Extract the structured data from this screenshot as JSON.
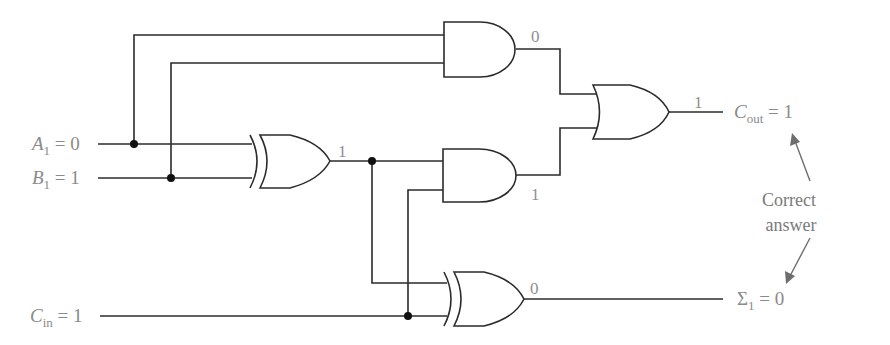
{
  "diagram": {
    "inputs": {
      "a1": {
        "symbol": "A",
        "subscript": "1",
        "eq": " = 0"
      },
      "b1": {
        "symbol": "B",
        "subscript": "1",
        "eq": " = 1"
      },
      "cin": {
        "symbol": "C",
        "subscript": "in",
        "eq": " = 1"
      }
    },
    "outputs": {
      "cout": {
        "symbol": "C",
        "subscript": "out",
        "eq": " = 1"
      },
      "sum": {
        "symbol": "Σ",
        "subscript": "1",
        "eq": " = 0"
      }
    },
    "gate_values": {
      "xor1_out": "1",
      "and_top_out": "0",
      "and_mid_out": "1",
      "or_out": "1",
      "xor2_out": "0"
    },
    "annotation": {
      "line1": "Correct",
      "line2": "answer"
    },
    "gates": [
      {
        "id": "xor1",
        "type": "XOR",
        "inputs": [
          "A1",
          "B1"
        ]
      },
      {
        "id": "and_top",
        "type": "AND",
        "inputs": [
          "A1",
          "B1"
        ]
      },
      {
        "id": "and_mid",
        "type": "AND",
        "inputs": [
          "XOR1",
          "Cin"
        ]
      },
      {
        "id": "or_cout",
        "type": "OR",
        "inputs": [
          "AND_top",
          "AND_mid"
        ]
      },
      {
        "id": "xor2",
        "type": "XOR",
        "inputs": [
          "XOR1",
          "Cin"
        ]
      }
    ],
    "colors": {
      "wire": "#2b2b2b",
      "label": "#8a8a8a",
      "arrow": "#6e6e6e"
    }
  }
}
